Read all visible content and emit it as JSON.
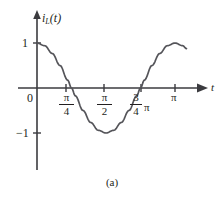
{
  "figure": {
    "caption": "(a)",
    "axes": {
      "y_axis_label": "i",
      "y_axis_label_sub": "L",
      "y_axis_label_arg": "(t)",
      "x_axis_label": "t",
      "origin_label": "0"
    },
    "y_ticks": [
      {
        "label": "1",
        "value": 1
      },
      {
        "label": "−1",
        "value": -1
      }
    ],
    "x_ticks": [
      {
        "numerator": "π",
        "denominator": "4",
        "trailing": "",
        "value": 0.7853981634
      },
      {
        "numerator": "π",
        "denominator": "2",
        "trailing": "",
        "value": 1.5707963268
      },
      {
        "numerator": "3",
        "denominator": "4",
        "trailing": "π",
        "value": 2.3561944902
      },
      {
        "numerator": "π",
        "denominator": "",
        "trailing": "",
        "value": 3.1415926536
      }
    ],
    "colors": {
      "curve": "#55555a",
      "axis": "#3b3b3f",
      "text": "#231f20",
      "background": "#ffffff"
    }
  },
  "chart_data": {
    "type": "line",
    "title": "",
    "subtitle": "",
    "xlabel": "t",
    "ylabel": "i_L(t)",
    "grid": false,
    "legend": "none",
    "xlim": [
      0,
      3.49
    ],
    "ylim": [
      -1.35,
      1.35
    ],
    "xtick_labels": [
      "0",
      "π/4",
      "π/2",
      "3π/4",
      "π"
    ],
    "xtick_values": [
      0,
      0.7853981634,
      1.5707963268,
      2.3561944902,
      3.1415926536
    ],
    "ytick_labels": [
      "1",
      "−1"
    ],
    "ytick_values": [
      1,
      -1
    ],
    "series": [
      {
        "name": "i_L(t) = cos(2t)",
        "expression": "cos(2t)",
        "x": [
          0,
          0.1745,
          0.3491,
          0.5236,
          0.6981,
          0.7854,
          0.8727,
          1.0472,
          1.2217,
          1.3963,
          1.5708,
          1.7453,
          1.9199,
          2.0944,
          2.2689,
          2.3562,
          2.4435,
          2.618,
          2.7925,
          2.9671,
          3.1416,
          3.3161,
          3.4034
        ],
        "y": [
          1.0,
          0.94,
          0.766,
          0.5,
          0.174,
          0.0,
          -0.174,
          -0.5,
          -0.766,
          -0.94,
          -1.0,
          -0.94,
          -0.766,
          -0.5,
          -0.174,
          0.0,
          0.174,
          0.5,
          0.766,
          0.94,
          1.0,
          0.94,
          0.875
        ]
      }
    ],
    "annotations": [
      {
        "text": "(a)",
        "role": "figure-caption"
      }
    ]
  }
}
